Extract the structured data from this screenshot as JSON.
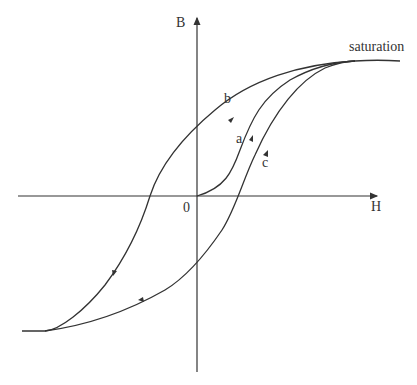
{
  "diagram": {
    "type": "hysteresis-loop",
    "axes": {
      "y_label": "B",
      "x_label": "H",
      "origin_label": "0"
    },
    "annotations": {
      "saturation": "saturation",
      "curve_a": "a",
      "curve_b": "b",
      "curve_c": "c"
    },
    "colors": {
      "stroke": "#333333",
      "background": "#ffffff"
    }
  }
}
